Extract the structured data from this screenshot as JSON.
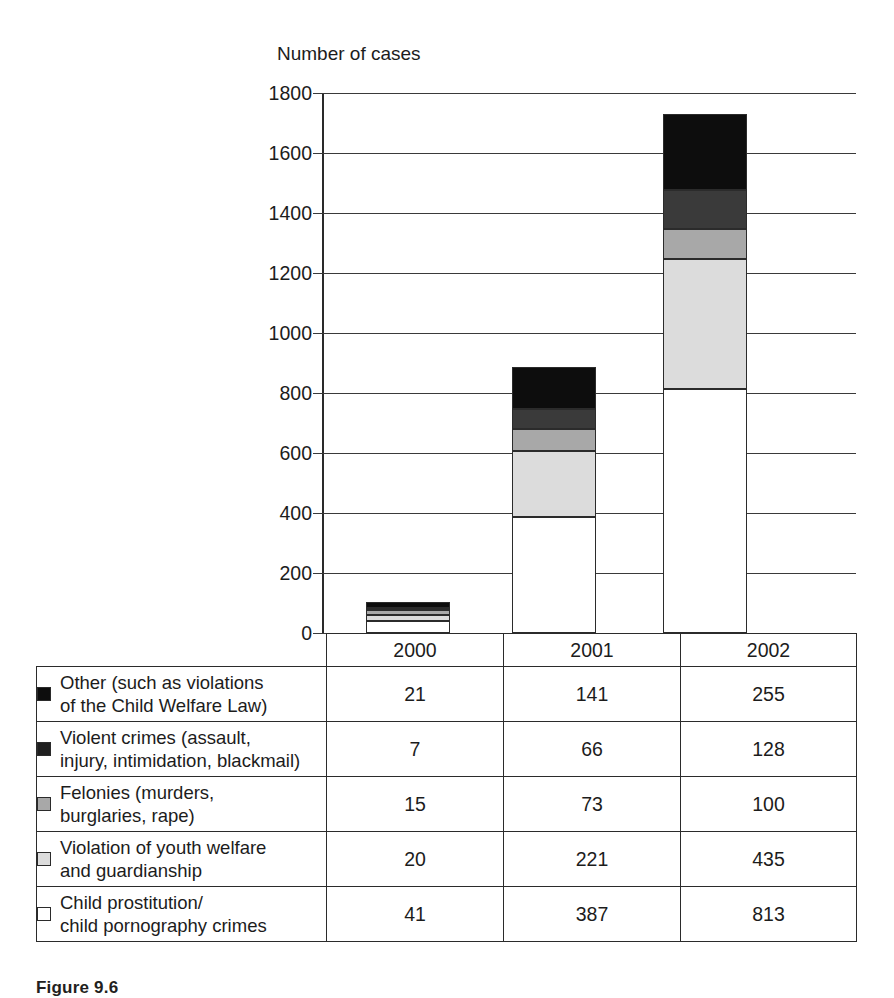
{
  "chart_data": {
    "type": "bar",
    "subtype": "stacked-bar",
    "title": "",
    "ylabel": "Number of cases",
    "xlabel": "",
    "ylim": [
      0,
      1800
    ],
    "ytick_step": 200,
    "yticks": [
      "1800",
      "1600",
      "1400",
      "1200",
      "1000",
      "800",
      "600",
      "400",
      "200",
      "0"
    ],
    "grid": true,
    "legend_position": "table-below",
    "categories": [
      "2000",
      "2001",
      "2002"
    ],
    "stack_order_bottom_to_top": [
      "Child prostitution/ child pornography crimes",
      "Violation of youth welfare and guardianship",
      "Felonies (murders, burglaries, rape)",
      "Violent crimes (assault, injury, intimidation, blackmail)",
      "Other (such as violations of the Child Welfare Law)"
    ],
    "series": [
      {
        "name": "Other (such as violations of the Child Welfare Law)",
        "line1": "Other (such as violations",
        "line2": "of the Child Welfare Law)",
        "color": "#0d0d0d",
        "values": [
          21,
          141,
          255
        ]
      },
      {
        "name": "Violent crimes (assault, injury, intimidation, blackmail)",
        "line1": "Violent crimes (assault,",
        "line2": "injury, intimidation, blackmail)",
        "color": "#3a3a3a",
        "values": [
          7,
          66,
          128
        ]
      },
      {
        "name": "Felonies (murders, burglaries, rape)",
        "line1": "Felonies (murders,",
        "line2": "burglaries, rape)",
        "color": "#a8a8a8",
        "values": [
          15,
          73,
          100
        ]
      },
      {
        "name": "Violation of youth welfare and guardianship",
        "line1": "Violation of youth welfare",
        "line2": "and guardianship",
        "color": "#dcdcdc",
        "values": [
          20,
          221,
          435
        ]
      },
      {
        "name": "Child prostitution/ child pornography crimes",
        "line1": "Child prostitution/",
        "line2": "child pornography crimes",
        "color": "#ffffff",
        "values": [
          41,
          387,
          813
        ]
      }
    ],
    "totals": [
      104,
      888,
      1731
    ],
    "legend_swatch_colors": [
      "#0d0d0d",
      "#1f1f1f",
      "#a8a8a8",
      "#dcdcdc",
      "#ffffff"
    ]
  },
  "table": {
    "header_year_labels": [
      "2000",
      "2001",
      "2002"
    ]
  },
  "caption": {
    "text": "Figure 9.6"
  },
  "colors": {
    "axis": "#2a2a2a",
    "grid": "#3a3a3a",
    "text": "#1c1c1c",
    "page_background": "#ffffff"
  }
}
